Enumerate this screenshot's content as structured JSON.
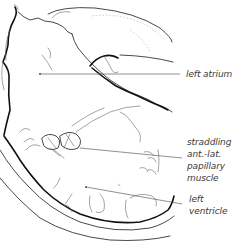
{
  "figure": {
    "colors": {
      "ink": "#111111",
      "label": "#3a3a3a",
      "background": "#ffffff"
    }
  },
  "labels": {
    "left_atrium": "left atrium",
    "papillary": [
      "straddling",
      "ant.-lat.",
      "papillary",
      "muscle"
    ],
    "left_ventricle": [
      "left",
      "ventricle"
    ]
  }
}
